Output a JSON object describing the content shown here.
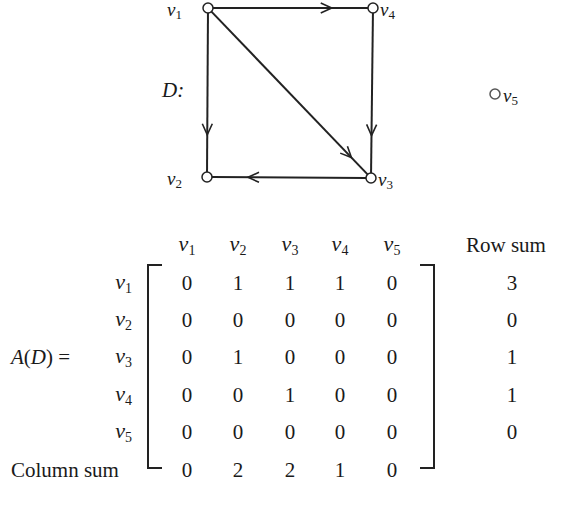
{
  "graph": {
    "name": "D",
    "label": "D:",
    "vertices": [
      {
        "id": "v1",
        "base": "v",
        "sub": "1",
        "x": 208,
        "y": 8
      },
      {
        "id": "v2",
        "base": "v",
        "sub": "2",
        "x": 207,
        "y": 177
      },
      {
        "id": "v3",
        "base": "v",
        "sub": "3",
        "x": 371,
        "y": 178
      },
      {
        "id": "v4",
        "base": "v",
        "sub": "4",
        "x": 373,
        "y": 8
      },
      {
        "id": "v5",
        "base": "v",
        "sub": "5",
        "x": 495,
        "y": 94
      }
    ],
    "arcs": [
      {
        "from": "v1",
        "to": "v4"
      },
      {
        "from": "v1",
        "to": "v2"
      },
      {
        "from": "v1",
        "to": "v3"
      },
      {
        "from": "v4",
        "to": "v3"
      },
      {
        "from": "v3",
        "to": "v2"
      }
    ]
  },
  "matrix": {
    "label": "A(D) =",
    "column_headers": [
      {
        "base": "v",
        "sub": "1"
      },
      {
        "base": "v",
        "sub": "2"
      },
      {
        "base": "v",
        "sub": "3"
      },
      {
        "base": "v",
        "sub": "4"
      },
      {
        "base": "v",
        "sub": "5"
      }
    ],
    "row_headers": [
      {
        "base": "v",
        "sub": "1"
      },
      {
        "base": "v",
        "sub": "2"
      },
      {
        "base": "v",
        "sub": "3"
      },
      {
        "base": "v",
        "sub": "4"
      },
      {
        "base": "v",
        "sub": "5"
      }
    ],
    "rows": [
      [
        "0",
        "1",
        "1",
        "1",
        "0"
      ],
      [
        "0",
        "0",
        "0",
        "0",
        "0"
      ],
      [
        "0",
        "1",
        "0",
        "0",
        "0"
      ],
      [
        "0",
        "0",
        "1",
        "0",
        "0"
      ],
      [
        "0",
        "0",
        "0",
        "0",
        "0"
      ]
    ],
    "row_sum_header": "Row sum",
    "row_sums": [
      "3",
      "0",
      "1",
      "1",
      "0"
    ],
    "column_sum_label": "Column sum",
    "column_sums": [
      "0",
      "2",
      "2",
      "1",
      "0"
    ]
  },
  "layout": {
    "col_x": [
      187,
      238,
      290,
      340,
      392
    ],
    "row_y": [
      283,
      320,
      357,
      395,
      432
    ],
    "header_y": 245,
    "rowsum_x": 512,
    "colsum_y": 470,
    "rowlabel_right_x": 122
  },
  "colors": {
    "stroke": "#222222",
    "text": "#1a1a1a",
    "background": "#ffffff"
  }
}
